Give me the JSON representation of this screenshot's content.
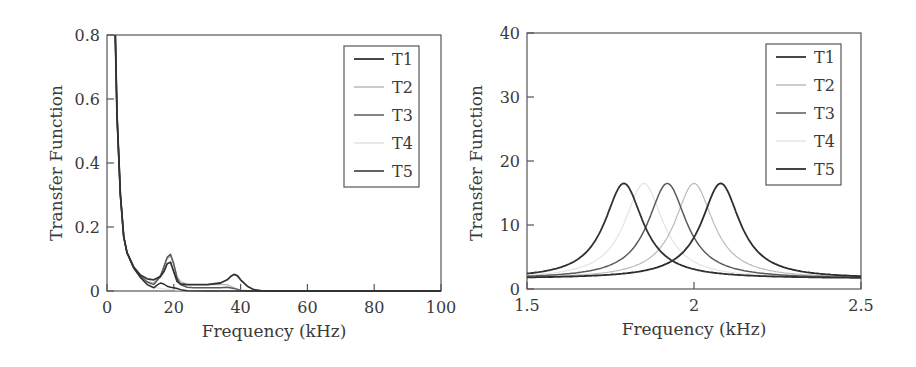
{
  "chart_data": [
    {
      "type": "line",
      "title": "",
      "xlabel": "Frequency (kHz)",
      "ylabel": "Transfer Function",
      "xlim": [
        0,
        100
      ],
      "ylim": [
        0,
        0.8
      ],
      "xticks": [
        0,
        20,
        40,
        60,
        80,
        100
      ],
      "xtick_labels": [
        "0",
        "20",
        "40",
        "60",
        "80",
        "100"
      ],
      "yticks": [
        0,
        0.2,
        0.4,
        0.6,
        0.8
      ],
      "ytick_labels": [
        "0",
        "0.2",
        "0.4",
        "0.6",
        "0.8"
      ],
      "grid": false,
      "legend_position": "upper right",
      "series": [
        {
          "name": "T1",
          "color": "#333333",
          "width": 1.8,
          "x": [
            2.5,
            3,
            4,
            5,
            6,
            8,
            10,
            12,
            14,
            16,
            17,
            18,
            19,
            20,
            21,
            22,
            24,
            26,
            30,
            34,
            36,
            37,
            38,
            39,
            40,
            42,
            44,
            46,
            50,
            60,
            80,
            100
          ],
          "y": [
            0.8,
            0.55,
            0.3,
            0.17,
            0.12,
            0.075,
            0.05,
            0.038,
            0.035,
            0.045,
            0.06,
            0.085,
            0.09,
            0.06,
            0.03,
            0.022,
            0.02,
            0.02,
            0.02,
            0.025,
            0.035,
            0.045,
            0.052,
            0.048,
            0.035,
            0.015,
            0.004,
            0.001,
            0,
            0,
            0,
            0
          ]
        },
        {
          "name": "T2",
          "color": "#b8b8b8",
          "width": 1.2,
          "x": [
            2.5,
            3,
            4,
            5,
            6,
            8,
            10,
            12,
            14,
            16,
            17,
            18,
            19,
            20,
            21,
            22,
            24,
            26,
            30,
            34,
            36,
            38,
            40,
            42,
            46,
            60,
            100
          ],
          "y": [
            0.8,
            0.55,
            0.3,
            0.17,
            0.12,
            0.073,
            0.048,
            0.03,
            0.025,
            0.05,
            0.075,
            0.1,
            0.11,
            0.08,
            0.045,
            0.03,
            0.02,
            0.02,
            0.02,
            0.02,
            0.02,
            0.01,
            0.003,
            0.001,
            0,
            0,
            0
          ]
        },
        {
          "name": "T3",
          "color": "#5a5a5a",
          "width": 1.5,
          "x": [
            2.5,
            3,
            4,
            5,
            6,
            8,
            10,
            12,
            14,
            16,
            17,
            18,
            19,
            20,
            21,
            22,
            24,
            26,
            30,
            34,
            36,
            38,
            40,
            44,
            60,
            100
          ],
          "y": [
            0.8,
            0.55,
            0.3,
            0.17,
            0.12,
            0.073,
            0.046,
            0.028,
            0.02,
            0.045,
            0.075,
            0.105,
            0.115,
            0.085,
            0.04,
            0.02,
            0.012,
            0.01,
            0.01,
            0.01,
            0.012,
            0.008,
            0.002,
            0,
            0,
            0
          ]
        },
        {
          "name": "T4",
          "color": "#e2e2e2",
          "width": 1.2,
          "x": [
            2.5,
            3,
            4,
            5,
            6,
            8,
            10,
            12,
            14,
            16,
            18,
            20,
            22,
            24,
            30,
            36,
            40,
            60,
            100
          ],
          "y": [
            0.8,
            0.55,
            0.3,
            0.17,
            0.12,
            0.072,
            0.044,
            0.024,
            0.012,
            0.008,
            0.006,
            0.004,
            0.002,
            0.001,
            0,
            0,
            0,
            0,
            0
          ]
        },
        {
          "name": "T5",
          "color": "#2e2e2e",
          "width": 1.5,
          "x": [
            2.5,
            3,
            4,
            5,
            6,
            8,
            10,
            12,
            14,
            15,
            16,
            17,
            18,
            19,
            20,
            21,
            22,
            24,
            30,
            40,
            60,
            100
          ],
          "y": [
            0.8,
            0.55,
            0.3,
            0.17,
            0.12,
            0.072,
            0.042,
            0.02,
            0.01,
            0.018,
            0.025,
            0.022,
            0.015,
            0.012,
            0.01,
            0.008,
            0.004,
            0.001,
            0,
            0,
            0,
            0
          ]
        }
      ]
    },
    {
      "type": "line",
      "title": "",
      "xlabel": "Frequency (kHz)",
      "ylabel": "Transfer Function",
      "xlim": [
        1.5,
        2.5
      ],
      "ylim": [
        0,
        40
      ],
      "xticks": [
        1.5,
        2,
        2.5
      ],
      "xtick_labels": [
        "1.5",
        "2",
        "2.5"
      ],
      "yticks": [
        0,
        10,
        20,
        30,
        40
      ],
      "ytick_labels": [
        "0",
        "10",
        "20",
        "30",
        "40"
      ],
      "grid": false,
      "legend_position": "upper right",
      "series": [
        {
          "name": "T1",
          "color": "#333333",
          "width": 1.8,
          "peak_freq": 1.79,
          "peak_value": 16.5
        },
        {
          "name": "T2",
          "color": "#bcbcbc",
          "width": 1.2,
          "peak_freq": 2.0,
          "peak_value": 16.5
        },
        {
          "name": "T3",
          "color": "#5a5a5a",
          "width": 1.5,
          "peak_freq": 1.92,
          "peak_value": 16.5
        },
        {
          "name": "T4",
          "color": "#e4e4e4",
          "width": 1.2,
          "peak_freq": 1.85,
          "peak_value": 16.5
        },
        {
          "name": "T5",
          "color": "#2e2e2e",
          "width": 1.8,
          "peak_freq": 2.08,
          "peak_value": 16.5
        }
      ],
      "curve_model": "lorentzian, baseline ~2 at 1.5 kHz, half-width ~0.07 kHz"
    }
  ],
  "left": {
    "xlabel": "Frequency (kHz)",
    "ylabel": "Transfer Function",
    "legend": [
      "T1",
      "T2",
      "T3",
      "T4",
      "T5"
    ]
  },
  "right": {
    "xlabel": "Frequency (kHz)",
    "ylabel": "Transfer Function",
    "legend": [
      "T1",
      "T2",
      "T3",
      "T4",
      "T5"
    ]
  }
}
